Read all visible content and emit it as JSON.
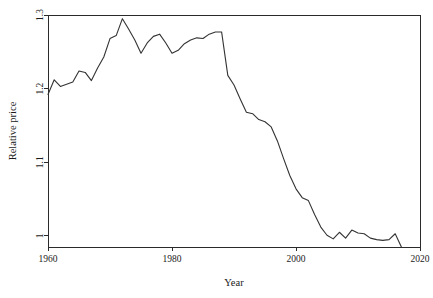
{
  "chart_data": {
    "type": "line",
    "title": "",
    "subtitle": "",
    "xlabel": "Year",
    "ylabel": "Relative price",
    "xlim": [
      1960,
      2020
    ],
    "ylim": [
      0.985,
      1.3
    ],
    "grid": false,
    "legend": null,
    "legend_position": "none",
    "xticks": [
      1960,
      1980,
      2000,
      2020
    ],
    "xtick_labels": [
      "1960",
      "1980",
      "2000",
      "2020"
    ],
    "yticks": [
      1,
      1.1,
      1.2,
      1.3
    ],
    "ytick_labels": [
      "1",
      "1.1",
      "1.2",
      "1.3"
    ],
    "series": [
      {
        "name": "Relative price",
        "color": "#333333",
        "x": [
          1960,
          1961,
          1962,
          1963,
          1964,
          1965,
          1966,
          1967,
          1968,
          1969,
          1970,
          1971,
          1972,
          1973,
          1974,
          1975,
          1976,
          1977,
          1978,
          1979,
          1980,
          1981,
          1982,
          1983,
          1984,
          1985,
          1986,
          1987,
          1988,
          1989,
          1990,
          1991,
          1992,
          1993,
          1994,
          1995,
          1996,
          1997,
          1998,
          1999,
          2000,
          2001,
          2002,
          2003,
          2004,
          2005,
          2006,
          2007,
          2008,
          2009,
          2010,
          2011,
          2012,
          2013,
          2014,
          2015,
          2016,
          2017
        ],
        "values": [
          1.192,
          1.212,
          1.203,
          1.206,
          1.209,
          1.224,
          1.222,
          1.211,
          1.228,
          1.243,
          1.268,
          1.272,
          1.295,
          1.281,
          1.266,
          1.248,
          1.262,
          1.271,
          1.274,
          1.262,
          1.248,
          1.252,
          1.261,
          1.266,
          1.269,
          1.268,
          1.274,
          1.277,
          1.277,
          1.218,
          1.205,
          1.186,
          1.168,
          1.166,
          1.158,
          1.155,
          1.148,
          1.129,
          1.105,
          1.082,
          1.064,
          1.052,
          1.048,
          1.029,
          1.012,
          1.001,
          0.996,
          1.005,
          0.997,
          1.008,
          1.004,
          1.003,
          0.997,
          0.995,
          0.994,
          0.995,
          1.003,
          0.985
        ]
      }
    ]
  },
  "axes": {
    "x_title": "Year",
    "y_title": "Relative price"
  }
}
